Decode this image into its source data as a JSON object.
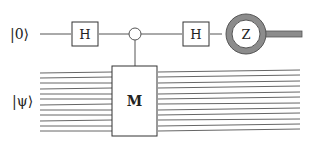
{
  "diagram": {
    "type": "quantum-circuit",
    "inputs": {
      "ancilla_label": "|0⟩",
      "register_label": "|ψ⟩"
    },
    "gates": {
      "hadamard_1": "H",
      "hadamard_2": "H",
      "controlled_unitary": "M",
      "measurement": "Z"
    },
    "register_wire_count": 12,
    "colors": {
      "wire": "#555555",
      "gate_border": "#333333",
      "meter_ring": "#8c8c8c",
      "background": "#ffffff"
    }
  }
}
